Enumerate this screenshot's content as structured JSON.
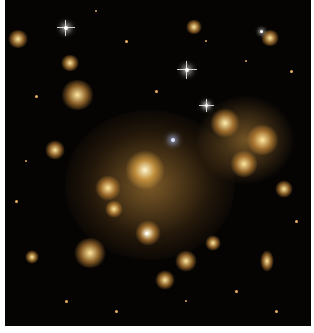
{
  "image": {
    "description": "Deep-space photograph of a galaxy cluster: a dense central concentration of golden-yellow elliptical galaxies on a black background, scattered with smaller galaxies, faint arcs and a few bright diffraction-spiked foreground stars",
    "colors": {
      "background": "#060403",
      "cluster_core": "#d8a040",
      "border": "#ffffff"
    }
  }
}
